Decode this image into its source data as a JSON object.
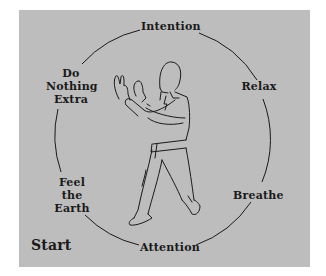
{
  "diagram": {
    "labels": {
      "top": "Intention",
      "upper_left": [
        "Do",
        "Nothing",
        "Extra"
      ],
      "right": "Relax",
      "lower_right": "Breathe",
      "bottom": "Attention",
      "lower_left": [
        "Feel",
        "the",
        "Earth"
      ]
    },
    "start_label": "Start",
    "colors": {
      "background": "#bdbdbd",
      "line": "#1a1a1a",
      "text": "#1a1a1a"
    }
  }
}
